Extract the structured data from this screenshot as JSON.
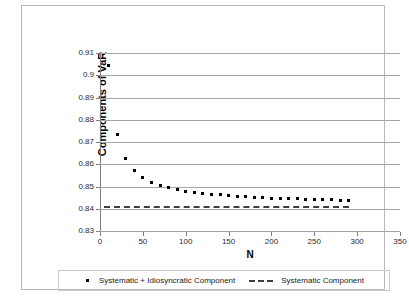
{
  "chart_data": {
    "type": "scatter",
    "title": "",
    "xlabel": "N",
    "ylabel": "Components of VaR",
    "xlim": [
      0,
      350
    ],
    "ylim": [
      0.83,
      0.91
    ],
    "xticks": [
      0,
      50,
      100,
      150,
      200,
      250,
      300,
      350
    ],
    "yticks": [
      "0.83",
      "0.84",
      "0.85",
      "0.86",
      "0.87",
      "0.88",
      "0.89",
      "0.9",
      "0.91"
    ],
    "ytick_values": [
      0.83,
      0.84,
      0.85,
      0.86,
      0.87,
      0.88,
      0.89,
      0.9,
      0.91
    ],
    "grid": "horizontal",
    "legend_position": "bottom",
    "series": [
      {
        "name": "Systematic + Idiosyncratic Component",
        "type": "scatter",
        "marker": "square-dot",
        "color": "#000000",
        "x": [
          10,
          20,
          30,
          40,
          50,
          60,
          70,
          80,
          90,
          100,
          110,
          120,
          130,
          140,
          150,
          160,
          170,
          180,
          190,
          200,
          210,
          220,
          230,
          240,
          250,
          260,
          270,
          280,
          290
        ],
        "y": [
          0.9045,
          0.8733,
          0.8627,
          0.8573,
          0.854,
          0.852,
          0.8505,
          0.8494,
          0.8486,
          0.8479,
          0.8473,
          0.8469,
          0.8465,
          0.8462,
          0.8459,
          0.8456,
          0.8454,
          0.8452,
          0.845,
          0.8448,
          0.8447,
          0.8445,
          0.8444,
          0.8443,
          0.8442,
          0.8441,
          0.844,
          0.8439,
          0.8438
        ]
      },
      {
        "name": "Systematic Component",
        "type": "line",
        "style": "dashed",
        "color": "#3d3d3d",
        "constant_y": 0.8413,
        "x_range": [
          5,
          290
        ]
      }
    ],
    "legend_entries": [
      {
        "label": "Systematic + Idiosyncratic Component",
        "marker": "square-dot"
      },
      {
        "label": "Systematic Component",
        "marker": "dashed-line"
      }
    ]
  }
}
